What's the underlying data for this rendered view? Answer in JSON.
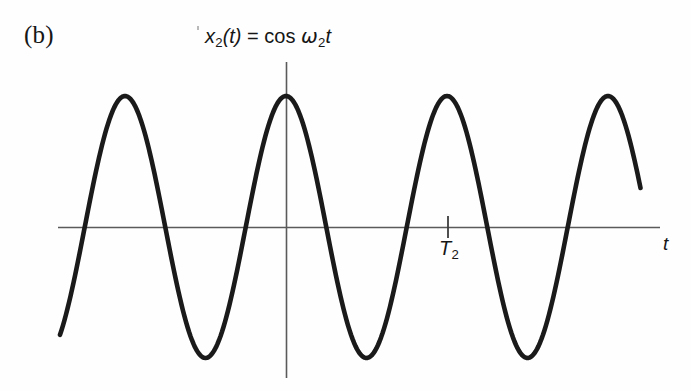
{
  "figure": {
    "panel_label": "(b)",
    "equation": {
      "full_text": "x2(t) = cos ω2t",
      "lhs_var": "x",
      "lhs_sub": "2",
      "lhs_arg": "(t)",
      "equals": "=",
      "fn": "cos",
      "omega": "ω",
      "omega_sub": "2",
      "time_var": "t"
    },
    "axis": {
      "x_label": "t",
      "tick_label": "T",
      "tick_sub": "2",
      "axis_color": "#5a5a5a",
      "curve_color": "#1a1a1a",
      "background": "#fefefe"
    }
  },
  "chart_data": {
    "type": "line",
    "title": "x2(t) = cos ω2t",
    "xlabel": "t",
    "ylabel": "",
    "function": "cos(w2*t)",
    "amplitude": 1,
    "period": 1,
    "phase": 0,
    "grid": false,
    "legend": null,
    "axis_origin_px": [
      286,
      227
    ],
    "period_px": 161,
    "amplitude_px": 131,
    "x_axis_range_px": [
      58,
      660
    ],
    "curve_range_px": [
      60,
      641
    ],
    "vertical_axis_range_px": [
      62,
      378
    ],
    "peaks_t": [
      -1,
      0,
      1,
      2
    ],
    "peaks_px_x": [
      125,
      286,
      447,
      608
    ],
    "troughs_t": [
      -0.5,
      0.5,
      1.5
    ],
    "troughs_px_x": [
      205,
      366,
      527
    ],
    "annotations": [
      {
        "label": "T2",
        "t": 1,
        "px_x": 448,
        "type": "x-tick"
      }
    ],
    "x_ticks": [
      {
        "value": 1,
        "label": "T2"
      }
    ],
    "y_ticks": [],
    "samples_note": "Cosine sampled continuously from t=-1.40 to t=2.21"
  }
}
